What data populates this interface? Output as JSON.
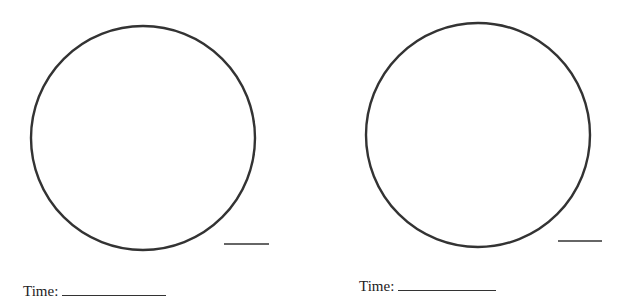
{
  "panels": [
    {
      "circle": {
        "cx": 143,
        "cy": 138,
        "r": 112
      },
      "answer_line": {
        "x1": 224,
        "x2": 269,
        "y": 244
      },
      "time_label": "Time:",
      "time_value": ""
    },
    {
      "circle": {
        "cx": 478,
        "cy": 135,
        "r": 112
      },
      "answer_line": {
        "x1": 558,
        "x2": 602,
        "y": 241
      },
      "time_label": "Time:",
      "time_value": ""
    }
  ],
  "colors": {
    "stroke": "#333333",
    "text": "#222222",
    "background": "#ffffff"
  }
}
